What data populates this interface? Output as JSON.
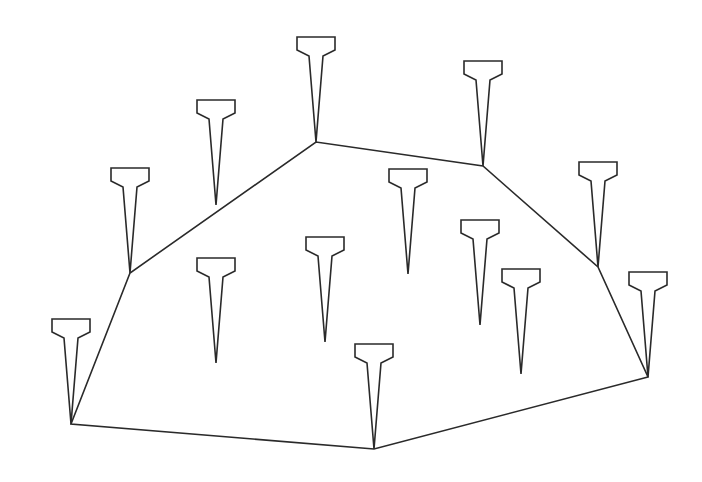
{
  "diagram": {
    "stroke_color": "#2a2a2a",
    "background": "#ffffff",
    "pin_shape": {
      "head_half_width": 19,
      "head_top_offset": 105,
      "shoulder_offset": 92,
      "neck_half_width": 7,
      "neck_offset": 86
    },
    "pins": [
      {
        "id": "p1",
        "tip": [
          316,
          142
        ],
        "on_hull": true
      },
      {
        "id": "p2",
        "tip": [
          483,
          166
        ],
        "on_hull": true
      },
      {
        "id": "p3",
        "tip": [
          216,
          205
        ],
        "on_hull": true
      },
      {
        "id": "p4",
        "tip": [
          130,
          273
        ],
        "on_hull": true
      },
      {
        "id": "p5",
        "tip": [
          598,
          267
        ],
        "on_hull": true
      },
      {
        "id": "p6",
        "tip": [
          408,
          274
        ],
        "on_hull": false
      },
      {
        "id": "p7",
        "tip": [
          480,
          325
        ],
        "on_hull": false
      },
      {
        "id": "p8",
        "tip": [
          325,
          342
        ],
        "on_hull": false
      },
      {
        "id": "p9",
        "tip": [
          216,
          363
        ],
        "on_hull": false
      },
      {
        "id": "p10",
        "tip": [
          521,
          374
        ],
        "on_hull": false
      },
      {
        "id": "p11",
        "tip": [
          648,
          377
        ],
        "on_hull": true
      },
      {
        "id": "p12",
        "tip": [
          71,
          424
        ],
        "on_hull": true
      },
      {
        "id": "p13",
        "tip": [
          374,
          449
        ],
        "on_hull": true
      }
    ],
    "hull": [
      [
        71,
        424
      ],
      [
        130,
        273
      ],
      [
        316,
        142
      ],
      [
        483,
        166
      ],
      [
        598,
        267
      ],
      [
        648,
        377
      ],
      [
        374,
        449
      ]
    ]
  }
}
